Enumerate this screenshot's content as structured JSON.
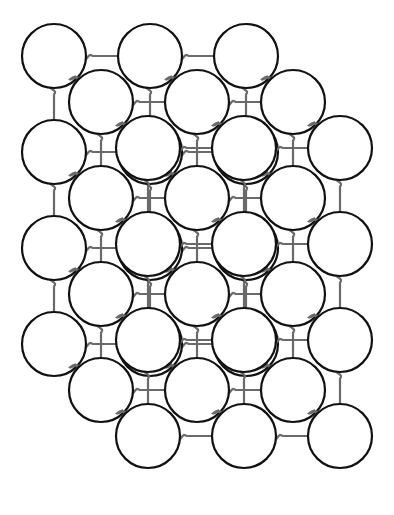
{
  "diagram": {
    "title": "",
    "lattice": {
      "columns": 3,
      "rows": 4,
      "depth_layers": 3,
      "spacing_x": 96,
      "spacing_y": 96,
      "depth_offset": [
        -47,
        -46
      ],
      "front_origin": [
        148,
        148
      ],
      "atom_radius": 32
    },
    "colors": {
      "atom_stroke": "#111111",
      "atom_fill": "#ffffff",
      "spring": "#6a6a6a",
      "background": "#ffffff"
    },
    "legend": []
  }
}
